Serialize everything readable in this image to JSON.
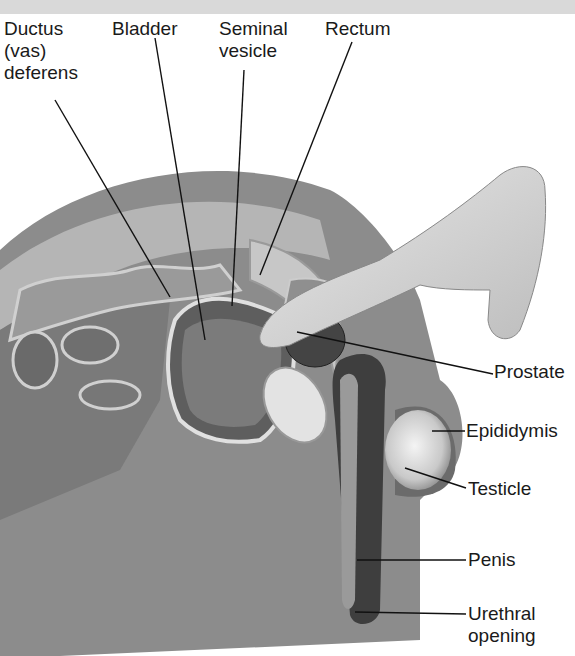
{
  "figure": {
    "type": "anatomical-illustration"
  },
  "labels": {
    "ductus": "Ductus\n(vas)\ndeferens",
    "bladder": "Bladder",
    "seminal": "Seminal\nvesicle",
    "rectum": "Rectum",
    "prostate": "Prostate",
    "epididymis": "Epididymis",
    "testicle": "Testicle",
    "penis": "Penis",
    "urethral": "Urethral\nopening"
  }
}
